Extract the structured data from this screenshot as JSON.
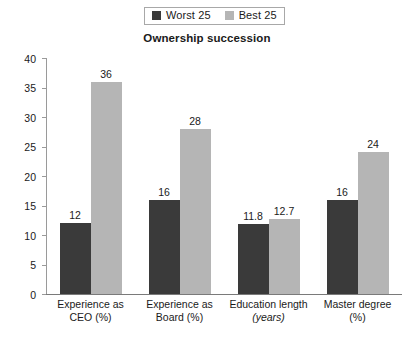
{
  "chart_data": {
    "type": "bar",
    "title": "Ownership succession",
    "xlabel": "",
    "ylabel": "",
    "ylim": [
      0,
      40
    ],
    "ytick_step": 5,
    "yticks": [
      0,
      5,
      10,
      15,
      20,
      25,
      30,
      35,
      40
    ],
    "grid": false,
    "legend_position": "top-center",
    "categories": [
      "Experience as CEO (%)",
      "Experience as Board (%)",
      "Education length (years)",
      "Master degree (%)"
    ],
    "category_lines": [
      {
        "line1": "Experience as",
        "line2": "CEO (%)",
        "line2_italic": false
      },
      {
        "line1": "Experience as",
        "line2": "Board (%)",
        "line2_italic": false
      },
      {
        "line1": "Education length",
        "line2": "(years)",
        "line2_italic": true
      },
      {
        "line1": "Master degree",
        "line2": "(%)",
        "line2_italic": false
      }
    ],
    "series": [
      {
        "name": "Worst 25",
        "color": "#3a3a3a",
        "values": [
          12,
          16,
          11.8,
          16
        ],
        "labels": [
          "12",
          "16",
          "11.8",
          "16"
        ]
      },
      {
        "name": "Best 25",
        "color": "#b5b5b5",
        "values": [
          36,
          28,
          12.7,
          24
        ],
        "labels": [
          "36",
          "28",
          "12.7",
          "24"
        ]
      }
    ]
  },
  "legend": {
    "entries": [
      {
        "label": "Worst 25",
        "color": "#3a3a3a"
      },
      {
        "label": "Best 25",
        "color": "#b5b5b5"
      }
    ]
  },
  "axis": {
    "y_tick_labels": [
      "40",
      "35",
      "30",
      "25",
      "20",
      "15",
      "10",
      "5",
      "0"
    ]
  },
  "colors": {
    "worst25": "#3a3a3a",
    "best25": "#b5b5b5",
    "axis": "#8a8a8a",
    "text": "#1a1a1a",
    "background": "#ffffff"
  }
}
